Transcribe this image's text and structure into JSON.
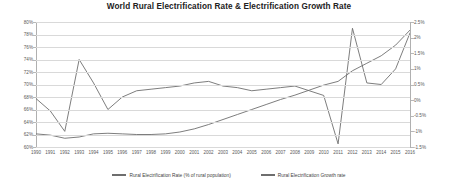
{
  "chart_data": {
    "type": "line",
    "title": "World Rural Electrification Rate & Electrification Growth Rate",
    "xlabel": "",
    "ylabel": "",
    "grid": true,
    "legend_position": "bottom",
    "x": [
      1990,
      1991,
      1992,
      1993,
      1994,
      1995,
      1996,
      1997,
      1998,
      1999,
      2000,
      2001,
      2002,
      2003,
      2004,
      2005,
      2006,
      2007,
      2008,
      2009,
      2010,
      2011,
      2012,
      2013,
      2014,
      2015,
      2016
    ],
    "categories": [
      "1990",
      "1991",
      "1992",
      "1993",
      "1994",
      "1995",
      "1996",
      "1997",
      "1998",
      "1999",
      "2000",
      "2001",
      "2002",
      "2003",
      "2004",
      "2005",
      "2006",
      "2007",
      "2008",
      "2009",
      "2010",
      "2011",
      "2012",
      "2013",
      "2014",
      "2015",
      "2016"
    ],
    "axes": {
      "left": {
        "label": "",
        "ylim": [
          60,
          80
        ],
        "step": 2,
        "ticks": [
          "60%",
          "62%",
          "64%",
          "66%",
          "68%",
          "70%",
          "72%",
          "74%",
          "76%",
          "78%",
          "80%"
        ]
      },
      "right": {
        "label": "",
        "ylim": [
          -1.5,
          2.5
        ],
        "step": 0.5,
        "ticks": [
          "-1.5%",
          "-1%",
          "-0.5%",
          "0%",
          "0.5%",
          "1%",
          "1.5%",
          "2%",
          "2.5%"
        ]
      }
    },
    "series": [
      {
        "name": "Rural Electrification Rate (% of rural population)",
        "axis": "left",
        "color": "#6e6e6e",
        "values": [
          62.1,
          61.9,
          61.4,
          61.6,
          62.1,
          62.2,
          62.1,
          62.0,
          62.0,
          62.1,
          62.4,
          62.9,
          63.6,
          64.4,
          65.2,
          66.0,
          66.8,
          67.6,
          68.3,
          69.1,
          69.9,
          70.5,
          72.2,
          73.4,
          74.6,
          76.3,
          78.7
        ]
      },
      {
        "name": "Rural Electrification Growth rate",
        "axis": "right",
        "color": "#6e6e6e",
        "values": [
          0.05,
          -0.35,
          -1.0,
          1.3,
          0.55,
          -0.3,
          0.1,
          0.3,
          0.35,
          0.4,
          0.45,
          0.55,
          0.6,
          0.45,
          0.4,
          0.3,
          0.35,
          0.4,
          0.45,
          0.3,
          0.15,
          -1.4,
          2.3,
          0.55,
          0.5,
          1.0,
          2.15
        ]
      }
    ]
  },
  "legend": {
    "items": [
      {
        "label": "Rural Electrification Rate (% of rural population)",
        "icon": "line-swatch-icon"
      },
      {
        "label": "Rural Electrification Growth rate",
        "icon": "line-swatch-icon"
      }
    ]
  }
}
